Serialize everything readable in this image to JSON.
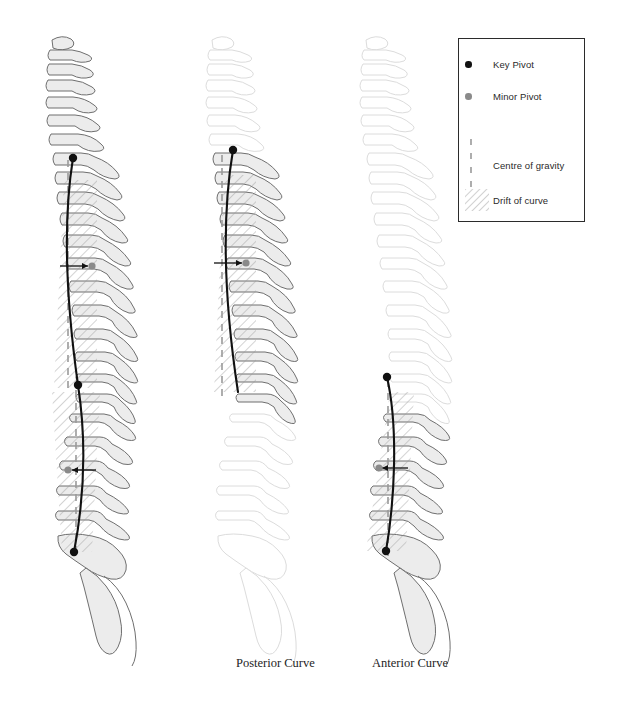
{
  "figure": {
    "title_visible": false,
    "background": "#ffffff",
    "captions": [
      {
        "id": "posterior",
        "label": "Posterior Curve",
        "x": 236,
        "y": 656
      },
      {
        "id": "anterior",
        "label": "Anterior Curve",
        "x": 372,
        "y": 656
      }
    ]
  },
  "legend": {
    "border_color": "#2b2b2b",
    "background": "#ffffff",
    "x": 458,
    "y": 38,
    "width": 127,
    "height": 184,
    "items": [
      {
        "id": "key-pivot",
        "label": "Key Pivot",
        "swatch": "key-pivot-dot",
        "color": "#111111",
        "row_y": 20
      },
      {
        "id": "minor-pivot",
        "label": "Minor Pivot",
        "swatch": "minor-pivot-dot",
        "color": "#8a8a8a",
        "row_y": 52
      },
      {
        "id": "cog",
        "label": "Centre of gravity",
        "swatch": "dashed-vertical",
        "color": "#9a9a9a",
        "row_y": 105
      },
      {
        "id": "drift",
        "label": "Drift of curve",
        "swatch": "diagonal-hatch",
        "color": "#9a9a9a",
        "row_y": 155
      }
    ]
  },
  "colors": {
    "bone_stroke_active": "#6f6f6f",
    "bone_fill_active": "#ececec",
    "bone_stroke_faded": "#dcdcdc",
    "bone_fill_faded": "#ffffff",
    "curve_line": "#111111",
    "cog_dash": "#9a9a9a",
    "hatch": "#9a9a9a",
    "shade_fill": "#dedede",
    "key_pivot": "#111111",
    "minor_pivot": "#8a8a8a",
    "arrow": "#111111"
  },
  "spines": [
    {
      "id": "spine-full",
      "name": "full-curve-spine",
      "x_offset": 0,
      "cervical_state": "active",
      "thoracic_state": "active",
      "lumbar_state": "active",
      "curve": {
        "from_y": 158,
        "to_y": 552
      },
      "key_pivots": [
        {
          "x": 73,
          "y": 158
        },
        {
          "x": 78,
          "y": 385
        },
        {
          "x": 74,
          "y": 552
        }
      ],
      "minor_pivots": [
        {
          "x": 92,
          "y": 266,
          "arrow_from_x": 60,
          "arrow_y": 266
        },
        {
          "x": 68,
          "y": 470,
          "arrow_from_x": 96,
          "arrow_y": 470
        }
      ],
      "cog_segments": [
        {
          "x": 68,
          "y1": 160,
          "y2": 390
        },
        {
          "x": 76,
          "y1": 388,
          "y2": 556
        }
      ],
      "drift_bands": [
        {
          "x1": 62,
          "y1": 180,
          "x2": 97,
          "y2": 388
        },
        {
          "x1": 50,
          "y1": 392,
          "x2": 100,
          "y2": 552
        }
      ]
    },
    {
      "id": "spine-posterior",
      "name": "posterior-curve-spine",
      "x_offset": 168,
      "cervical_state": "faded",
      "thoracic_state": "active",
      "lumbar_state": "faded",
      "curve": {
        "from_y": 150,
        "to_y": 392
      },
      "key_pivots": [
        {
          "x": 233,
          "y": 150
        }
      ],
      "minor_pivots": [
        {
          "x": 246,
          "y": 263,
          "arrow_from_x": 214,
          "arrow_y": 263
        }
      ],
      "cog_segments": [
        {
          "x": 222,
          "y1": 155,
          "y2": 392
        }
      ],
      "drift_bands": [
        {
          "x1": 216,
          "y1": 172,
          "x2": 252,
          "y2": 388
        }
      ]
    },
    {
      "id": "spine-anterior",
      "name": "anterior-curve-spine",
      "x_offset": 322,
      "cervical_state": "faded",
      "thoracic_state": "faded",
      "lumbar_state": "active",
      "curve": {
        "from_y": 377,
        "to_y": 551
      },
      "key_pivots": [
        {
          "x": 387,
          "y": 377
        },
        {
          "x": 386,
          "y": 551
        }
      ],
      "minor_pivots": [
        {
          "x": 379,
          "y": 468,
          "arrow_from_x": 408,
          "arrow_y": 468
        }
      ],
      "cog_segments": [
        {
          "x": 388,
          "y1": 380,
          "y2": 556
        }
      ],
      "drift_bands": [
        {
          "x1": 362,
          "y1": 392,
          "x2": 412,
          "y2": 551
        }
      ]
    }
  ]
}
